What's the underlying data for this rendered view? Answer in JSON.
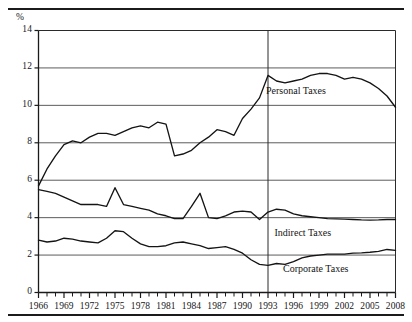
{
  "figure": {
    "unit_label": "%",
    "rules": {
      "top": true,
      "bottom": true
    }
  },
  "chart_data": {
    "type": "line",
    "title": "",
    "subtitle": "",
    "xlabel": "",
    "ylabel": "%",
    "xlim": [
      1966,
      2008
    ],
    "ylim": [
      0,
      14
    ],
    "yticks": [
      0,
      2,
      4,
      6,
      8,
      10,
      12,
      14
    ],
    "ytick_labels": [
      "0",
      "2",
      "4",
      "6",
      "8",
      "10",
      "12",
      "14"
    ],
    "xticks": [
      1966,
      1969,
      1972,
      1975,
      1978,
      1981,
      1984,
      1987,
      1990,
      1993,
      1996,
      1999,
      2002,
      2005,
      2008
    ],
    "xtick_labels": [
      "1966",
      "1969",
      "1972",
      "1975",
      "1978",
      "1981",
      "1984",
      "1987",
      "1990",
      "1993",
      "1996",
      "1999",
      "2002",
      "2005",
      "2008"
    ],
    "minor_xticks_every": 1,
    "grid": "horizontal",
    "gridlines_y": [
      2,
      4,
      6,
      8,
      10,
      12
    ],
    "legend": "inline-annotations",
    "annotations": [
      {
        "text": "Personal Taxes",
        "x": 1997.0,
        "y": 10.7
      },
      {
        "text": "Indirect Taxes",
        "x": 1998.0,
        "y": 3.15
      },
      {
        "text": "Corporate Taxes",
        "x": 1999.0,
        "y": 1.2
      }
    ],
    "vline": {
      "x": 1993,
      "label": ""
    },
    "x": [
      1966,
      1967,
      1968,
      1969,
      1970,
      1971,
      1972,
      1973,
      1974,
      1975,
      1976,
      1977,
      1978,
      1979,
      1980,
      1981,
      1982,
      1983,
      1984,
      1985,
      1986,
      1987,
      1988,
      1989,
      1990,
      1991,
      1992,
      1993,
      1994,
      1995,
      1996,
      1997,
      1998,
      1999,
      2000,
      2001,
      2002,
      2003,
      2004,
      2005,
      2006,
      2007,
      2008
    ],
    "series": [
      {
        "name": "Personal Taxes",
        "color": "#141414",
        "values": [
          5.7,
          6.6,
          7.3,
          7.9,
          8.1,
          8.0,
          8.3,
          8.5,
          8.5,
          8.4,
          8.6,
          8.8,
          8.9,
          8.8,
          9.1,
          9.0,
          7.3,
          7.4,
          7.6,
          8.0,
          8.3,
          8.7,
          8.6,
          8.4,
          9.3,
          9.8,
          10.4,
          11.6,
          11.3,
          11.2,
          11.3,
          11.4,
          11.6,
          11.7,
          11.7,
          11.6,
          11.4,
          11.5,
          11.4,
          11.2,
          10.9,
          10.5,
          9.9
        ]
      },
      {
        "name": "Indirect Taxes",
        "color": "#141414",
        "values": [
          5.5,
          5.4,
          5.3,
          5.1,
          4.9,
          4.7,
          4.7,
          4.7,
          4.6,
          5.6,
          4.7,
          4.6,
          4.5,
          4.4,
          4.2,
          4.1,
          3.95,
          3.95,
          4.6,
          5.3,
          4.0,
          3.95,
          4.1,
          4.3,
          4.35,
          4.3,
          3.9,
          4.3,
          4.45,
          4.4,
          4.2,
          4.1,
          4.05,
          4.0,
          3.95,
          3.93,
          3.92,
          3.9,
          3.88,
          3.87,
          3.88,
          3.9,
          3.9
        ]
      },
      {
        "name": "Corporate Taxes",
        "color": "#141414",
        "values": [
          2.8,
          2.7,
          2.75,
          2.9,
          2.85,
          2.75,
          2.7,
          2.65,
          2.9,
          3.3,
          3.25,
          2.9,
          2.6,
          2.45,
          2.45,
          2.5,
          2.65,
          2.7,
          2.6,
          2.5,
          2.35,
          2.4,
          2.45,
          2.3,
          2.1,
          1.75,
          1.5,
          1.45,
          1.55,
          1.5,
          1.65,
          1.85,
          1.95,
          2.0,
          2.05,
          2.05,
          2.05,
          2.1,
          2.12,
          2.15,
          2.2,
          2.3,
          2.25
        ]
      }
    ]
  }
}
